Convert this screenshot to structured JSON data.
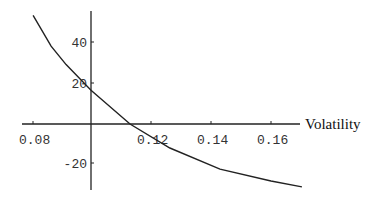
{
  "chart_data": {
    "type": "line",
    "title": "",
    "xlabel": "Volatility",
    "ylabel": "",
    "xlim": [
      0.08,
      0.175
    ],
    "ylim": [
      -33,
      55
    ],
    "x_ticks": [
      0.08,
      0.12,
      0.14,
      0.16
    ],
    "x_tick_labels": [
      "0.08",
      "0.12",
      "0.14",
      "0.16"
    ],
    "y_ticks": [
      40,
      20,
      -20
    ],
    "y_tick_labels": [
      "40",
      "20",
      "-20"
    ],
    "axes_origin": {
      "x": 0.1,
      "y": 0
    },
    "grid": false,
    "legend": null,
    "series": [
      {
        "name": "curve",
        "color": "#222222",
        "x": [
          0.0807,
          0.0867,
          0.0917,
          0.1,
          0.113,
          0.1263,
          0.143,
          0.16,
          0.1703
        ],
        "y": [
          53,
          38,
          29,
          16.5,
          0,
          -11.7,
          -22,
          -27.8,
          -30.7
        ]
      }
    ]
  },
  "colors": {
    "axis": "#222222",
    "curve": "#222222",
    "background": "#ffffff"
  }
}
